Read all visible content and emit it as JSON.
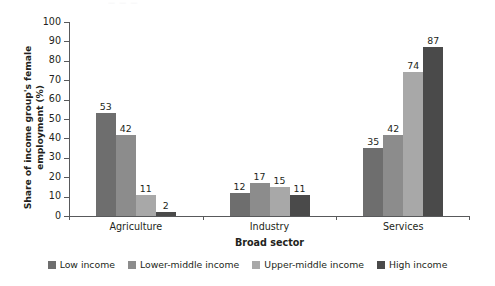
{
  "figure": {
    "title_remnant": "—  — —",
    "background_color": "#ffffff"
  },
  "chart_data": {
    "type": "bar",
    "title": "",
    "subtitle": "",
    "xlabel": "Broad sector",
    "ylabel": "Share of income group's female employment (%)",
    "categories": [
      "Agriculture",
      "Industry",
      "Services"
    ],
    "series": [
      {
        "name": "Low income",
        "color": "#6e6e6e",
        "values": [
          53,
          12,
          35
        ]
      },
      {
        "name": "Lower-middle income",
        "color": "#8c8c8c",
        "values": [
          42,
          17,
          42
        ]
      },
      {
        "name": "Upper-middle income",
        "color": "#a8a8a8",
        "values": [
          11,
          15,
          74
        ]
      },
      {
        "name": "High income",
        "color": "#4a4a4a",
        "values": [
          2,
          11,
          87
        ]
      }
    ],
    "ylim": [
      0,
      100
    ],
    "ytick_values": [
      0,
      10,
      20,
      30,
      40,
      50,
      60,
      70,
      80,
      90,
      100
    ],
    "ytick_labels": [
      "0",
      "10",
      "20",
      "30",
      "40",
      "50",
      "60",
      "70",
      "80",
      "90",
      "100"
    ],
    "grid": false,
    "show_data_labels": true,
    "legend_position": "bottom-center",
    "axis_color": "#58595b",
    "text_color": "#231f20"
  }
}
